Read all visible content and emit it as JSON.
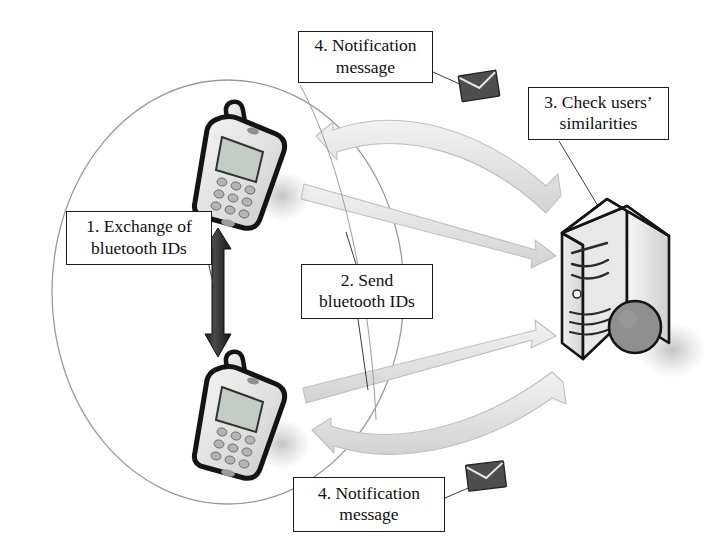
{
  "diagram": {
    "type": "flow-diagram",
    "background_color": "#ffffff",
    "line_color": "#1c1c1c",
    "arrow_fill": "#e2e2e2",
    "arrow_stroke": "#b8b8b8",
    "dark_arrow_color": "#2b2b2b",
    "ellipse_stroke": "#8c8c8c"
  },
  "callouts": [
    {
      "id": "notify-top",
      "text": "4. Notification\nmessage",
      "step": "4"
    },
    {
      "id": "check",
      "text": "3. Check users’\nsimilarities",
      "step": "3"
    },
    {
      "id": "exchange",
      "text": "1. Exchange of\nbluetooth IDs",
      "step": "1"
    },
    {
      "id": "send",
      "text": "2. Send\nbluetooth IDs",
      "step": "2"
    },
    {
      "id": "notify-bot",
      "text": "4. Notification\nmessage",
      "step": "4"
    }
  ],
  "nodes": {
    "phone_top": {
      "label": "mobile-phone",
      "shadow": true
    },
    "phone_bottom": {
      "label": "mobile-phone",
      "shadow": true
    },
    "server": {
      "label": "server",
      "shadow": true
    },
    "proximity_zone": {
      "label": "bluetooth-proximity-ellipse"
    }
  },
  "icons": {
    "envelope_top": "envelope-icon",
    "envelope_bottom": "envelope-icon"
  },
  "flows": [
    {
      "step": "1",
      "from": "phone_top",
      "to": "phone_bottom",
      "direction": "bidirectional",
      "style": "dark-solid"
    },
    {
      "step": "2",
      "from": "phone_top",
      "to": "server",
      "direction": "right",
      "style": "gray-band"
    },
    {
      "step": "2",
      "from": "phone_bottom",
      "to": "server",
      "direction": "right",
      "style": "gray-band"
    },
    {
      "step": "4",
      "from": "server",
      "to": "phone_top",
      "direction": "left",
      "style": "gray-band-curved"
    },
    {
      "step": "4",
      "from": "server",
      "to": "phone_bottom",
      "direction": "left",
      "style": "gray-band-curved"
    }
  ]
}
